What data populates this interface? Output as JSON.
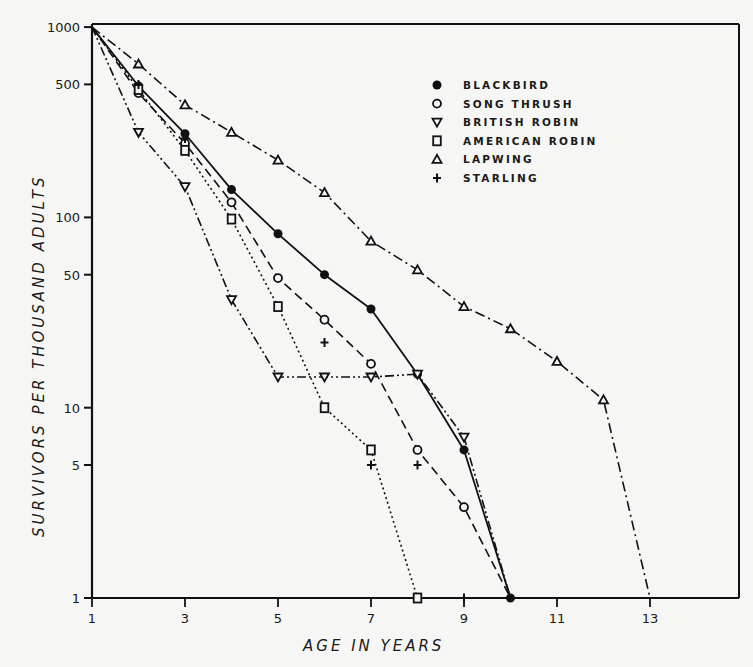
{
  "chart_data": {
    "type": "line",
    "title": "",
    "xlabel": "AGE IN YEARS",
    "ylabel": "SURVIVORS PER THOUSAND ADULTS",
    "yscale": "log",
    "xlim": [
      1,
      15
    ],
    "ylim": [
      1,
      1000
    ],
    "x_ticks": [
      1,
      3,
      5,
      7,
      9,
      11,
      13
    ],
    "y_ticks": [
      1,
      5,
      10,
      50,
      100,
      500,
      1000
    ],
    "grid": false,
    "legend_position": "upper right (inside)",
    "series": [
      {
        "name": "BLACKBIRD",
        "marker": "filled-circle",
        "linestyle": "solid",
        "x": [
          1,
          2,
          3,
          4,
          5,
          6,
          7,
          8,
          9,
          10
        ],
        "values": [
          1000,
          490,
          275,
          140,
          82,
          50,
          33,
          15,
          6,
          1
        ]
      },
      {
        "name": "SONG THRUSH",
        "marker": "open-circle",
        "linestyle": "dashed",
        "x": [
          1,
          2,
          3,
          4,
          5,
          6,
          7,
          8,
          9,
          10
        ],
        "values": [
          1000,
          450,
          245,
          120,
          48,
          29,
          17,
          6,
          3,
          1
        ]
      },
      {
        "name": "BRITISH ROBIN",
        "marker": "open-triangle-down",
        "linestyle": "dash-dot-dot",
        "x": [
          1,
          2,
          3,
          4,
          5,
          6,
          7,
          8,
          9,
          10
        ],
        "values": [
          1000,
          280,
          145,
          37,
          14.5,
          14.5,
          14.5,
          15,
          7,
          1
        ]
      },
      {
        "name": "AMERICAN ROBIN",
        "marker": "open-square",
        "linestyle": "dotted",
        "x": [
          1,
          2,
          3,
          4,
          5,
          6,
          7,
          8
        ],
        "values": [
          1000,
          470,
          225,
          98,
          34,
          10,
          6,
          1
        ]
      },
      {
        "name": "LAPWING",
        "marker": "open-triangle-up",
        "linestyle": "dash-dot",
        "x": [
          1,
          2,
          3,
          4,
          5,
          6,
          7,
          8,
          9,
          10,
          11,
          12,
          13
        ],
        "values": [
          1000,
          640,
          390,
          280,
          200,
          135,
          75,
          53,
          34,
          26,
          17.5,
          11,
          1
        ]
      },
      {
        "name": "STARLING",
        "marker": "plus",
        "linestyle": "none",
        "x": [
          2,
          3,
          6,
          7,
          8,
          9
        ],
        "values": [
          500,
          260,
          22,
          5,
          5,
          1
        ]
      }
    ]
  },
  "axes": {
    "xlabel": "AGE IN YEARS",
    "ylabel": "SURVIVORS PER THOUSAND ADULTS",
    "x_tick_labels": [
      "1",
      "3",
      "5",
      "7",
      "9",
      "11",
      "13"
    ],
    "y_tick_labels": [
      "1000",
      "500",
      "100",
      "50",
      "10",
      "5",
      "1"
    ]
  },
  "legend": {
    "items": [
      {
        "label": "BLACKBIRD",
        "symbol": "filled-circle"
      },
      {
        "label": "SONG THRUSH",
        "symbol": "open-circle"
      },
      {
        "label": "BRITISH ROBIN",
        "symbol": "open-triangle-down"
      },
      {
        "label": "AMERICAN ROBIN",
        "symbol": "open-square"
      },
      {
        "label": "LAPWING",
        "symbol": "open-triangle-up"
      },
      {
        "label": "STARLING",
        "symbol": "plus"
      }
    ]
  }
}
